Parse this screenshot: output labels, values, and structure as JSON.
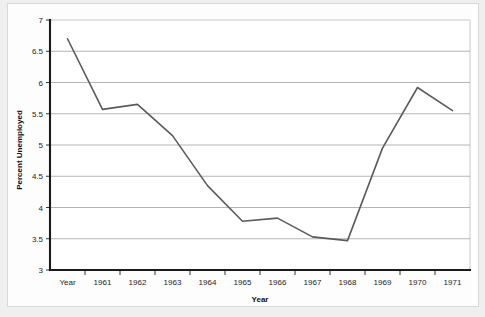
{
  "page": {
    "background_color": "#efefef",
    "sheet_color": "#fdfdfd"
  },
  "chart_data": {
    "type": "line",
    "title": "",
    "xlabel": "Year",
    "ylabel": "Percent Unemployed",
    "categories": [
      "Year",
      "1961",
      "1962",
      "1963",
      "1964",
      "1965",
      "1966",
      "1967",
      "1968",
      "1969",
      "1970",
      "1971"
    ],
    "values": [
      6.7,
      5.57,
      5.65,
      5.15,
      4.35,
      3.78,
      3.83,
      3.53,
      3.47,
      4.95,
      5.92,
      5.55
    ],
    "series": [
      {
        "name": "Percent Unemployed",
        "color": "#5b5b5b",
        "values": [
          6.7,
          5.57,
          5.65,
          5.15,
          4.35,
          3.78,
          3.83,
          3.53,
          3.47,
          4.95,
          5.92,
          5.55
        ]
      }
    ],
    "ylim": [
      3,
      7
    ],
    "ytick_labels": [
      "3",
      "3.5",
      "4",
      "4.5",
      "5",
      "5.5",
      "6",
      "6.5",
      "7"
    ],
    "ytick_values": [
      3,
      3.5,
      4,
      4.5,
      5,
      5.5,
      6,
      6.5,
      7
    ],
    "xtick_labels": [
      "Year",
      "1961",
      "1962",
      "1963",
      "1964",
      "1965",
      "1966",
      "1967",
      "1968",
      "1969",
      "1970",
      "1971"
    ],
    "grid": true,
    "grid_axis": "y",
    "legend": false,
    "legend_position": "none",
    "line_color": "#5b5b5b",
    "axis_color": "#1a1a1a",
    "gridline_color": "#a8a8a8",
    "plot_background": "#ffffff"
  }
}
